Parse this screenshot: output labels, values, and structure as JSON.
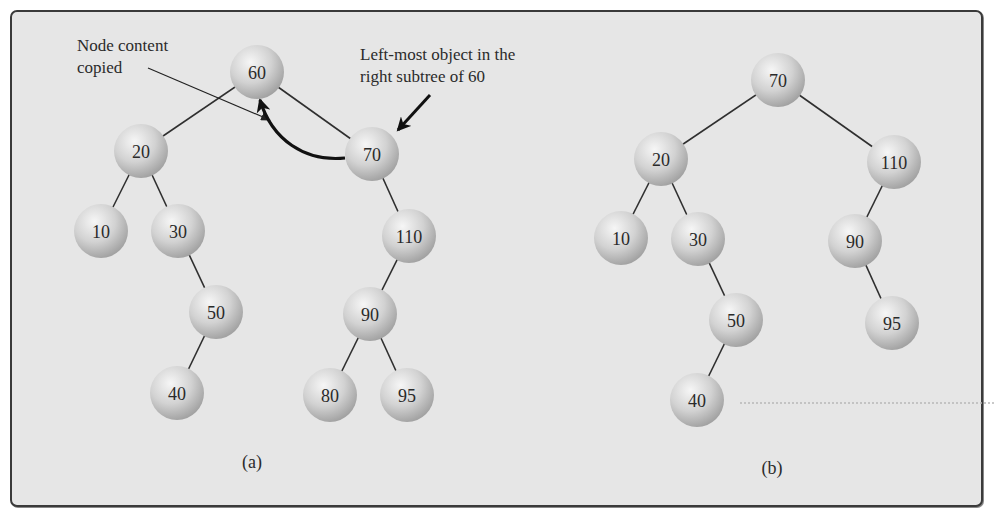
{
  "figure": {
    "colors": {
      "background": "#e6e6e6",
      "frame_border": "#3a3a3a",
      "node_light": "#f4f4f4",
      "node_mid": "#cfcfcf",
      "node_dark": "#9e9e9e",
      "edge": "#2f2f2f",
      "arrow": "#111111"
    }
  },
  "panel_a": {
    "caption": "(a)",
    "annotation_copied": [
      "Node content",
      "copied"
    ],
    "annotation_leftmost": [
      "Left-most object in the",
      "right subtree of 60"
    ],
    "nodes": [
      {
        "id": "a60",
        "label": "60",
        "x": 257,
        "y": 72
      },
      {
        "id": "a20",
        "label": "20",
        "x": 141,
        "y": 151
      },
      {
        "id": "a70",
        "label": "70",
        "x": 372,
        "y": 154
      },
      {
        "id": "a10",
        "label": "10",
        "x": 101,
        "y": 231
      },
      {
        "id": "a30",
        "label": "30",
        "x": 178,
        "y": 231
      },
      {
        "id": "a110",
        "label": "110",
        "x": 409,
        "y": 236
      },
      {
        "id": "a50",
        "label": "50",
        "x": 216,
        "y": 312
      },
      {
        "id": "a90",
        "label": "90",
        "x": 370,
        "y": 314
      },
      {
        "id": "a40",
        "label": "40",
        "x": 177,
        "y": 393
      },
      {
        "id": "a80",
        "label": "80",
        "x": 330,
        "y": 395
      },
      {
        "id": "a95",
        "label": "95",
        "x": 407,
        "y": 395
      }
    ],
    "edges": [
      [
        "a60",
        "a20"
      ],
      [
        "a60",
        "a70"
      ],
      [
        "a20",
        "a10"
      ],
      [
        "a20",
        "a30"
      ],
      [
        "a30",
        "a50"
      ],
      [
        "a50",
        "a40"
      ],
      [
        "a70",
        "a110"
      ],
      [
        "a110",
        "a90"
      ],
      [
        "a90",
        "a80"
      ],
      [
        "a90",
        "a95"
      ]
    ]
  },
  "panel_b": {
    "caption": "(b)",
    "nodes": [
      {
        "id": "b70",
        "label": "70",
        "x": 778,
        "y": 80
      },
      {
        "id": "b20",
        "label": "20",
        "x": 661,
        "y": 159
      },
      {
        "id": "b110",
        "label": "110",
        "x": 894,
        "y": 162
      },
      {
        "id": "b10",
        "label": "10",
        "x": 621,
        "y": 238
      },
      {
        "id": "b30",
        "label": "30",
        "x": 698,
        "y": 239
      },
      {
        "id": "b90",
        "label": "90",
        "x": 855,
        "y": 241
      },
      {
        "id": "b50",
        "label": "50",
        "x": 736,
        "y": 320
      },
      {
        "id": "b95",
        "label": "95",
        "x": 892,
        "y": 323
      },
      {
        "id": "b40",
        "label": "40",
        "x": 697,
        "y": 400
      }
    ],
    "edges": [
      [
        "b70",
        "b20"
      ],
      [
        "b70",
        "b110"
      ],
      [
        "b20",
        "b10"
      ],
      [
        "b20",
        "b30"
      ],
      [
        "b30",
        "b50"
      ],
      [
        "b50",
        "b40"
      ],
      [
        "b110",
        "b90"
      ],
      [
        "b90",
        "b95"
      ]
    ]
  }
}
